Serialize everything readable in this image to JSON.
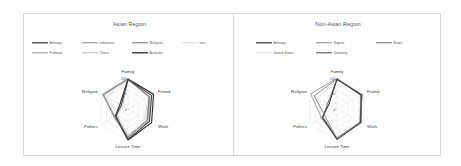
{
  "chart_data": [
    {
      "type": "radar",
      "title": "Asian Region",
      "categories": [
        "Family",
        "Friend",
        "Work",
        "Leisure Time",
        "Politics",
        "Religion"
      ],
      "rlim": [
        0,
        100
      ],
      "tick_labels": [
        "100",
        "50",
        "0"
      ],
      "grid": true,
      "legend_position": "top",
      "series": [
        {
          "name": "Average",
          "color": "#404040",
          "width": 1.1,
          "values": [
            95,
            88,
            80,
            98,
            45,
            25
          ]
        },
        {
          "name": "Indonesia",
          "color": "#8c8c8c",
          "width": 0.8,
          "values": [
            98,
            80,
            72,
            90,
            50,
            95
          ]
        },
        {
          "name": "Malaysia",
          "color": "#737373",
          "width": 0.8,
          "values": [
            96,
            78,
            70,
            92,
            52,
            92
          ]
        },
        {
          "name": "Iran",
          "color": "#cfcfcf",
          "width": 0.6,
          "values": [
            94,
            76,
            62,
            88,
            40,
            80
          ]
        },
        {
          "name": "Pakistan",
          "color": "#999999",
          "width": 0.8,
          "values": [
            97,
            80,
            75,
            95,
            48,
            90
          ]
        },
        {
          "name": "China",
          "color": "#b3b3b3",
          "width": 0.7,
          "values": [
            92,
            82,
            78,
            85,
            42,
            20
          ]
        },
        {
          "name": "Australia",
          "color": "#262626",
          "width": 1.1,
          "values": [
            97,
            95,
            88,
            100,
            48,
            30
          ]
        }
      ]
    },
    {
      "type": "radar",
      "title": "Non-Asian Region",
      "categories": [
        "Family",
        "Friend",
        "Work",
        "Leisure Time",
        "Politics",
        "Religion"
      ],
      "rlim": [
        0,
        100
      ],
      "tick_labels": [
        "100",
        "50",
        "0"
      ],
      "grid": true,
      "legend_position": "top",
      "series": [
        {
          "name": "Average",
          "color": "#404040",
          "width": 1.1,
          "values": [
            96,
            90,
            88,
            98,
            55,
            30
          ]
        },
        {
          "name": "Nigeria",
          "color": "#8c8c8c",
          "width": 0.8,
          "values": [
            99,
            88,
            85,
            92,
            58,
            98
          ]
        },
        {
          "name": "Brazil",
          "color": "#737373",
          "width": 0.8,
          "values": [
            97,
            92,
            90,
            96,
            45,
            85
          ]
        },
        {
          "name": "United States",
          "color": "#cfcfcf",
          "width": 0.6,
          "values": [
            96,
            93,
            88,
            95,
            60,
            70
          ]
        },
        {
          "name": "Germany",
          "color": "#595959",
          "width": 0.9,
          "values": [
            95,
            94,
            86,
            97,
            52,
            35
          ]
        }
      ]
    }
  ]
}
